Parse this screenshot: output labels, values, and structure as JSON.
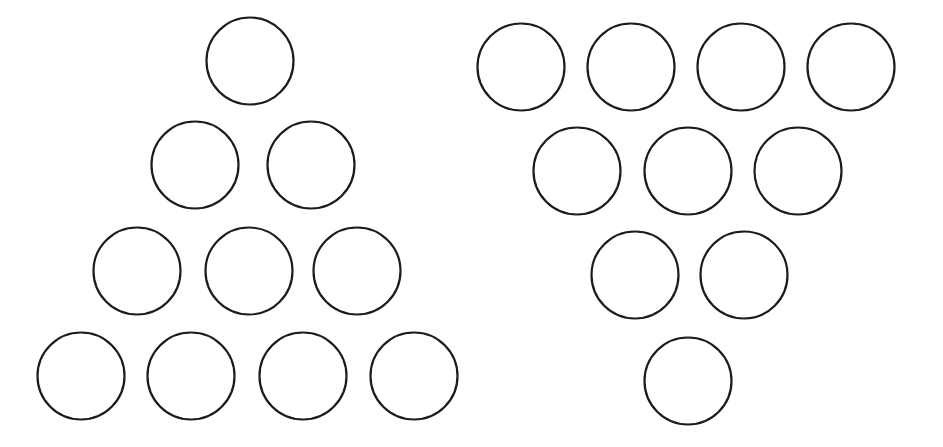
{
  "canvas": {
    "width": 943,
    "height": 447,
    "background_color": "#ffffff",
    "stroke_color": "#1c1c1c",
    "stroke_width": 2.2
  },
  "diagram": {
    "type": "circle-arrangement",
    "total_circles": 20,
    "circle_diameter": 87,
    "circle_radius": 43.5,
    "groups": [
      {
        "id": "left-group",
        "name": "upright-triangle",
        "count": 10,
        "rows_counts": [
          1,
          2,
          3,
          4
        ],
        "rows": [
          {
            "index": 0,
            "count": 1,
            "cy": 61,
            "circles": [
              {
                "cx": 250,
                "cy": 61,
                "r": 43.5
              }
            ]
          },
          {
            "index": 1,
            "count": 2,
            "cy": 165,
            "circles": [
              {
                "cx": 195,
                "cy": 165,
                "r": 43.5
              },
              {
                "cx": 311,
                "cy": 165,
                "r": 43.5
              }
            ]
          },
          {
            "index": 2,
            "count": 3,
            "cy": 271,
            "circles": [
              {
                "cx": 137,
                "cy": 271,
                "r": 43.5
              },
              {
                "cx": 249,
                "cy": 271,
                "r": 43.5
              },
              {
                "cx": 357,
                "cy": 271,
                "r": 43.5
              }
            ]
          },
          {
            "index": 3,
            "count": 4,
            "cy": 376,
            "circles": [
              {
                "cx": 81,
                "cy": 376,
                "r": 43.5
              },
              {
                "cx": 191,
                "cy": 376,
                "r": 43.5
              },
              {
                "cx": 303,
                "cy": 376,
                "r": 43.5
              },
              {
                "cx": 414,
                "cy": 376,
                "r": 43.5
              }
            ]
          }
        ]
      },
      {
        "id": "right-group",
        "name": "inverted-triangle",
        "count": 10,
        "rows_counts": [
          4,
          3,
          2,
          1
        ],
        "rows": [
          {
            "index": 0,
            "count": 4,
            "cy": 67,
            "circles": [
              {
                "cx": 521,
                "cy": 67,
                "r": 43.5
              },
              {
                "cx": 631,
                "cy": 67,
                "r": 43.5
              },
              {
                "cx": 741,
                "cy": 67,
                "r": 43.5
              },
              {
                "cx": 851,
                "cy": 67,
                "r": 43.5
              }
            ]
          },
          {
            "index": 1,
            "count": 3,
            "cy": 171,
            "circles": [
              {
                "cx": 577,
                "cy": 171,
                "r": 43.5
              },
              {
                "cx": 688,
                "cy": 171,
                "r": 43.5
              },
              {
                "cx": 798,
                "cy": 171,
                "r": 43.5
              }
            ]
          },
          {
            "index": 2,
            "count": 2,
            "cy": 275,
            "circles": [
              {
                "cx": 635,
                "cy": 275,
                "r": 43.5
              },
              {
                "cx": 744,
                "cy": 275,
                "r": 43.5
              }
            ]
          },
          {
            "index": 3,
            "count": 1,
            "cy": 381,
            "circles": [
              {
                "cx": 688,
                "cy": 381,
                "r": 43.5
              }
            ]
          }
        ]
      }
    ]
  }
}
